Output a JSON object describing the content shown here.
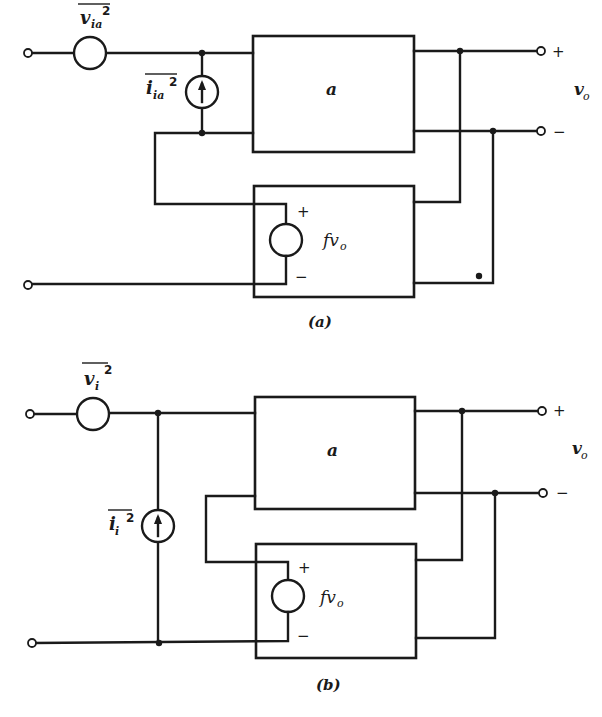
{
  "figure": {
    "a": {
      "caption": "(a)",
      "noise_voltage_source": {
        "label": "v",
        "subscript": "ia",
        "superscript": "2"
      },
      "noise_current_source": {
        "label": "i",
        "subscript": "ia",
        "superscript": "2"
      },
      "amplifier_label": "a",
      "feedback_source_label": "fv",
      "feedback_source_subscript": "o",
      "feedback_plus": "+",
      "feedback_minus": "−",
      "output_plus": "+",
      "output_minus": "−",
      "output_label": "v",
      "output_subscript": "o"
    },
    "b": {
      "caption": "(b)",
      "noise_voltage_source": {
        "label": "v",
        "subscript": "i",
        "superscript": "2"
      },
      "noise_current_source": {
        "label": "i",
        "subscript": "i",
        "superscript": "2"
      },
      "amplifier_label": "a",
      "feedback_source_label": "fv",
      "feedback_source_subscript": "o",
      "feedback_plus": "+",
      "feedback_minus": "−",
      "output_plus": "+",
      "output_minus": "−",
      "output_label": "v",
      "output_subscript": "o"
    }
  }
}
